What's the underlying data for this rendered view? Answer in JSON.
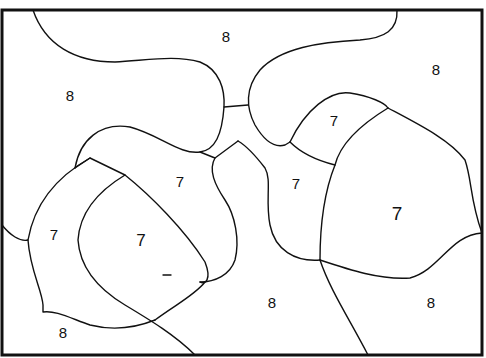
{
  "regions": [
    {
      "id": "top-center",
      "label": "8",
      "x": 226,
      "y": 36
    },
    {
      "id": "top-left",
      "label": "8",
      "x": 70,
      "y": 95
    },
    {
      "id": "top-right",
      "label": "8",
      "x": 436,
      "y": 69
    },
    {
      "id": "right-small",
      "label": "7",
      "x": 334,
      "y": 120
    },
    {
      "id": "center-left",
      "label": "7",
      "x": 180,
      "y": 181
    },
    {
      "id": "center-right",
      "label": "7",
      "x": 296,
      "y": 183
    },
    {
      "id": "right-large",
      "label": "7",
      "x": 397,
      "y": 213
    },
    {
      "id": "left-outer",
      "label": "7",
      "x": 54,
      "y": 234
    },
    {
      "id": "left-inner",
      "label": "7",
      "x": 141,
      "y": 240
    },
    {
      "id": "bottom-center",
      "label": "8",
      "x": 272,
      "y": 302
    },
    {
      "id": "bottom-right",
      "label": "8",
      "x": 431,
      "y": 302
    },
    {
      "id": "bottom-left",
      "label": "8",
      "x": 63,
      "y": 332
    }
  ],
  "colors": {
    "ink": "#111111",
    "paper": "#ffffff"
  }
}
